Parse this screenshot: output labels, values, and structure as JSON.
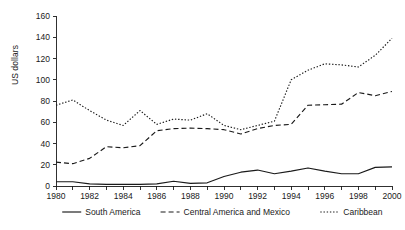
{
  "chart_data": {
    "type": "line",
    "title": "",
    "subtitle": "",
    "xlabel": "",
    "ylabel": "US dollars",
    "xlim": [
      1980,
      2000
    ],
    "ylim": [
      0,
      160
    ],
    "ytick_step": 20,
    "xtick_label_step": 2,
    "grid": false,
    "legend_position": "bottom",
    "x": [
      1980,
      1981,
      1982,
      1983,
      1984,
      1985,
      1986,
      1987,
      1988,
      1989,
      1990,
      1991,
      1992,
      1993,
      1994,
      1995,
      1996,
      1997,
      1998,
      1999,
      2000
    ],
    "x_tick_labels": [
      "1980",
      "1982",
      "1984",
      "1986",
      "1988",
      "1990",
      "1992",
      "1994",
      "1996",
      "1998",
      "2000"
    ],
    "y_tick_labels": [
      "0",
      "20",
      "40",
      "60",
      "80",
      "100",
      "120",
      "140",
      "160"
    ],
    "series": [
      {
        "name": "South America",
        "style": "solid",
        "color": "#1a1a1a",
        "values": [
          4,
          4,
          2,
          1.5,
          1.5,
          1.5,
          2,
          4.5,
          2.5,
          3,
          9,
          13,
          15,
          11.5,
          14,
          17,
          14,
          11.5,
          11.5,
          17.5,
          18
        ]
      },
      {
        "name": "Central America and Mexico",
        "style": "dashed",
        "color": "#1a1a1a",
        "values": [
          22.5,
          21,
          26,
          37,
          36,
          38,
          52,
          54,
          54.5,
          54,
          53,
          49,
          54,
          57,
          58,
          76,
          76.5,
          77,
          88,
          85,
          89
        ]
      },
      {
        "name": "Caribbean",
        "style": "dotted",
        "color": "#1a1a1a",
        "values": [
          76,
          81,
          71,
          62,
          57,
          71,
          58,
          63,
          62,
          68,
          57,
          53,
          57,
          61,
          100,
          109,
          115,
          114,
          112,
          123,
          139
        ]
      }
    ]
  },
  "legend": {
    "items": [
      {
        "label": "South America",
        "style": "solid"
      },
      {
        "label": "Central America and Mexico",
        "style": "dashed"
      },
      {
        "label": "Caribbean",
        "style": "dotted"
      }
    ]
  },
  "axes": {
    "y_axis_label": "US dollars"
  }
}
